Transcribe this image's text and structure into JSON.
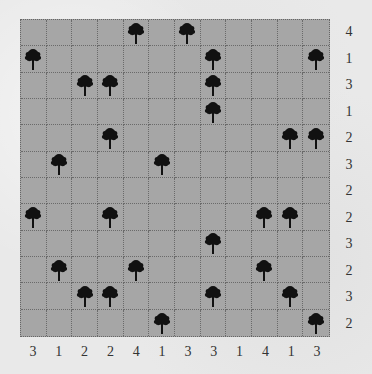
{
  "puzzle": {
    "type": "tents-and-trees",
    "rows": 12,
    "cols": 12,
    "row_clues": [
      4,
      1,
      3,
      1,
      2,
      3,
      2,
      2,
      3,
      2,
      3,
      2
    ],
    "col_clues": [
      3,
      1,
      2,
      2,
      4,
      1,
      3,
      3,
      1,
      4,
      1,
      3
    ],
    "trees": [
      [
        0,
        4
      ],
      [
        0,
        6
      ],
      [
        1,
        0
      ],
      [
        1,
        7
      ],
      [
        1,
        11
      ],
      [
        2,
        2
      ],
      [
        2,
        3
      ],
      [
        2,
        7
      ],
      [
        3,
        7
      ],
      [
        4,
        3
      ],
      [
        4,
        10
      ],
      [
        4,
        11
      ],
      [
        5,
        1
      ],
      [
        5,
        5
      ],
      [
        7,
        0
      ],
      [
        7,
        3
      ],
      [
        7,
        9
      ],
      [
        7,
        10
      ],
      [
        8,
        7
      ],
      [
        9,
        1
      ],
      [
        9,
        4
      ],
      [
        9,
        9
      ],
      [
        10,
        2
      ],
      [
        10,
        3
      ],
      [
        10,
        7
      ],
      [
        10,
        10
      ],
      [
        11,
        5
      ],
      [
        11,
        11
      ]
    ],
    "icons": {
      "tree": "palm-tree-icon"
    },
    "colors": {
      "background": "#e9e9e9",
      "grid_fill": "#a6a6a6",
      "grid_lines": "#6a6a6a",
      "tree": "#111111",
      "clue_text": "#333333"
    }
  }
}
